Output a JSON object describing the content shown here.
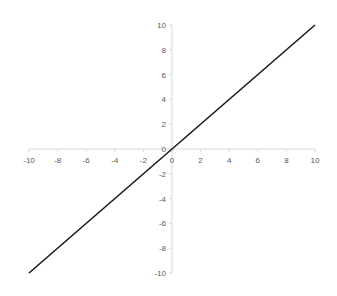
{
  "chart_data": {
    "type": "line",
    "title": "",
    "xlabel": "",
    "ylabel": "",
    "xlim": [
      -10,
      10
    ],
    "ylim": [
      -10,
      10
    ],
    "x_ticks": [
      -10,
      -8,
      -6,
      -4,
      -2,
      0,
      2,
      4,
      6,
      8,
      10
    ],
    "y_ticks": [
      -10,
      -8,
      -6,
      -4,
      -2,
      0,
      2,
      4,
      6,
      8,
      10
    ],
    "grid": false,
    "legend": null,
    "series": [
      {
        "name": "y = x",
        "x": [
          -10,
          10
        ],
        "y": [
          -10,
          10
        ],
        "color": "#1a1a1a"
      }
    ],
    "axis_color": "#d9d9d9",
    "label_color": "#595959"
  }
}
